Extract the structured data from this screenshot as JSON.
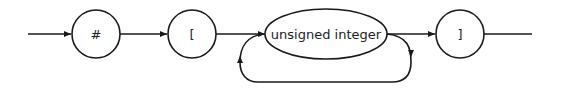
{
  "diagram": {
    "type": "syntax-railroad",
    "nodes": [
      {
        "id": "hash",
        "label": "#",
        "shape": "circle"
      },
      {
        "id": "lbracket",
        "label": "[",
        "shape": "circle"
      },
      {
        "id": "uint",
        "label": "unsigned integer",
        "shape": "ellipse"
      },
      {
        "id": "rbracket",
        "label": "]",
        "shape": "circle"
      }
    ],
    "edges": [
      {
        "from": "start",
        "to": "hash"
      },
      {
        "from": "hash",
        "to": "lbracket"
      },
      {
        "from": "lbracket",
        "to": "uint"
      },
      {
        "from": "uint",
        "to": "rbracket"
      },
      {
        "from": "uint",
        "to": "uint",
        "kind": "repeat-loop"
      },
      {
        "from": "rbracket",
        "to": "end"
      }
    ],
    "colors": {
      "stroke": "#1a1a1a",
      "background": "#ffffff"
    }
  }
}
